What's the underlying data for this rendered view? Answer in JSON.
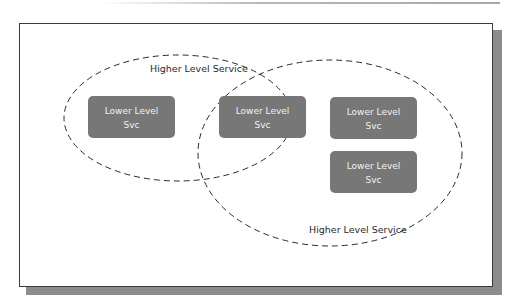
{
  "diagram": {
    "colors": {
      "box_fill": "#777777",
      "box_text": "#f2f2f2",
      "ellipse_stroke": "#2a2a2a",
      "frame_border": "#3a3a3a",
      "frame_shadow": "#8c8c8c"
    },
    "groups": [
      {
        "label": "Higher Level Service"
      },
      {
        "label": "Higher Level Service"
      }
    ],
    "boxes": [
      {
        "line1": "Lower Level",
        "line2": "Svc"
      },
      {
        "line1": "Lower Level",
        "line2": "Svc"
      },
      {
        "line1": "Lower Level",
        "line2": "Svc"
      },
      {
        "line1": "Lower Level",
        "line2": "Svc"
      }
    ]
  }
}
